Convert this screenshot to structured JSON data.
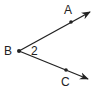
{
  "diagram": {
    "type": "angle",
    "vertex": {
      "label": "B",
      "x": 19,
      "y": 51
    },
    "angle_label": "2",
    "rays": [
      {
        "name": "BA",
        "point": {
          "label": "A",
          "x": 71,
          "y": 21
        },
        "end": {
          "x": 91,
          "y": 11
        }
      },
      {
        "name": "BC",
        "point": {
          "label": "C",
          "x": 66,
          "y": 70
        },
        "end": {
          "x": 89,
          "y": 79
        }
      }
    ],
    "colors": {
      "stroke": "#222222",
      "background": "#ffffff"
    }
  }
}
